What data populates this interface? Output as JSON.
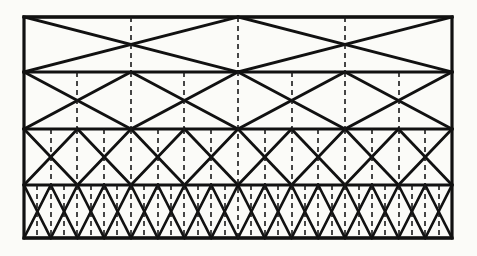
{
  "figure": {
    "kind": "truss-lattice-diagram",
    "background_color": "#fbfbf8",
    "line_color": "#111111",
    "dashed_color": "#1a1a1a",
    "canvas": {
      "width": 477,
      "height": 256
    }
  },
  "frame": {
    "left": 24,
    "right": 452,
    "top": 17,
    "bottom": 238,
    "stroke_width": 3.2,
    "label": "outer-rectangle"
  },
  "chords": {
    "label": "horizontal-chords",
    "count": 5,
    "y_positions": [
      17,
      72,
      129,
      185,
      238
    ],
    "stroke_width": 3.0
  },
  "bands": [
    {
      "index": 1,
      "name": "band-top",
      "y_top": 17,
      "y_bottom": 72,
      "bays": 2,
      "diagonal_stroke_width": 3.0,
      "dashed_verticals_x": [
        238
      ],
      "dashed_node_verticals_x": [
        131,
        345
      ],
      "description": "Two bays forming a single large crossing X across the full width."
    },
    {
      "index": 2,
      "name": "band-second",
      "y_top": 72,
      "y_bottom": 129,
      "bays": 4,
      "diagonal_stroke_width": 3.0,
      "dashed_verticals_x": [
        238
      ],
      "dashed_node_verticals_x": [
        77,
        131,
        184,
        292,
        345,
        399
      ],
      "description": "Four bays, bracing frequency doubled from the top band."
    },
    {
      "index": 3,
      "name": "band-third",
      "y_top": 129,
      "y_bottom": 185,
      "bays": 8,
      "diagonal_stroke_width": 2.8,
      "dashed_verticals_x": [
        238
      ],
      "dashed_node_verticals_x": [
        51,
        77,
        104,
        131,
        158,
        184,
        211,
        265,
        292,
        318,
        345,
        372,
        399,
        425
      ],
      "description": "Eight bays, bracing frequency doubled again."
    },
    {
      "index": 4,
      "name": "band-bottom",
      "y_top": 185,
      "y_bottom": 238,
      "bays": 16,
      "diagonal_stroke_width": 2.6,
      "dashed_verticals_x": [
        238
      ],
      "dashed_node_verticals_x": [
        37,
        51,
        64,
        77,
        91,
        104,
        117,
        131,
        144,
        158,
        171,
        184,
        198,
        211,
        225,
        251,
        265,
        278,
        292,
        305,
        318,
        332,
        345,
        359,
        372,
        385,
        399,
        412,
        425,
        439
      ],
      "description": "Sixteen bays, the densest bracing level."
    }
  ],
  "center_line": {
    "label": "center-dashed-vertical",
    "x": 238,
    "y_top": 17,
    "y_bottom": 238,
    "style": "dashed"
  },
  "dash_pattern": {
    "dash": 5,
    "gap": 4,
    "stroke_width": 1.6
  }
}
